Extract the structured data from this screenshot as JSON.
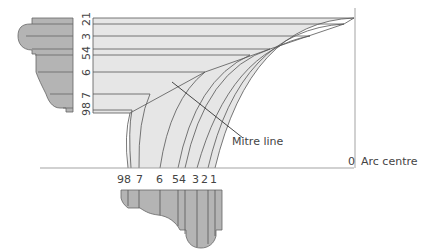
{
  "diagram": {
    "annotations": {
      "mitre_line": "Mitre line",
      "arc_centre_number": "0",
      "arc_centre": "Arc centre"
    },
    "vertical_labels": [
      "21",
      "3",
      "54",
      "6",
      "7",
      "98"
    ],
    "baseline_labels": [
      "98",
      "7",
      "6",
      "54",
      "3",
      "2",
      "1"
    ],
    "colors": {
      "fill_light": "#e6e6e6",
      "profile_fill": "#b4b4b4",
      "line": "#555555",
      "axis": "#999999"
    }
  }
}
